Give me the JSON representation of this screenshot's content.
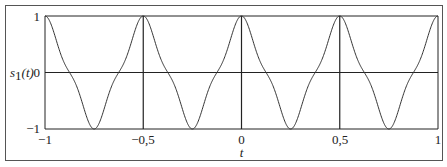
{
  "chart_data": {
    "type": "line",
    "title": "",
    "xlabel": "t",
    "ylabel": "s1(t)",
    "ylabel_main": "s",
    "ylabel_sub": "1",
    "ylabel_arg": "(t)",
    "xlim": [
      -1,
      1
    ],
    "ylim": [
      -1,
      1
    ],
    "x_ticks": [
      -1,
      -0.5,
      0,
      0.5,
      1
    ],
    "x_tick_labels": [
      "−1",
      "−0,5",
      "0",
      "0,5",
      "1"
    ],
    "y_ticks": [
      1,
      0,
      -1
    ],
    "y_tick_labels": [
      "1",
      "0",
      "−1"
    ],
    "grid": {
      "vertical_lines_at": [
        -0.5,
        0,
        0.5
      ],
      "horizontal_lines_at": [
        0
      ]
    },
    "legend": null,
    "series": [
      {
        "name": "s1(t)",
        "description": "periodic waveform, period 0.5, peaks +1 at t = -1, -0.5, 0, 0.5, 1; troughs -1 at t = ±0.25, ±0.75; flat shoulders at zero crossings",
        "x": [
          -1,
          -0.875,
          -0.75,
          -0.625,
          -0.5,
          -0.375,
          -0.25,
          -0.125,
          0,
          0.125,
          0.25,
          0.375,
          0.5,
          0.625,
          0.75,
          0.875,
          1
        ],
        "values": [
          1,
          0,
          -1,
          0,
          1,
          0,
          -1,
          0,
          1,
          0,
          -1,
          0,
          1,
          0,
          -1,
          0,
          1
        ]
      }
    ]
  },
  "colors": {
    "line": "#333333",
    "axis": "#222222",
    "background": "#ffffff"
  }
}
